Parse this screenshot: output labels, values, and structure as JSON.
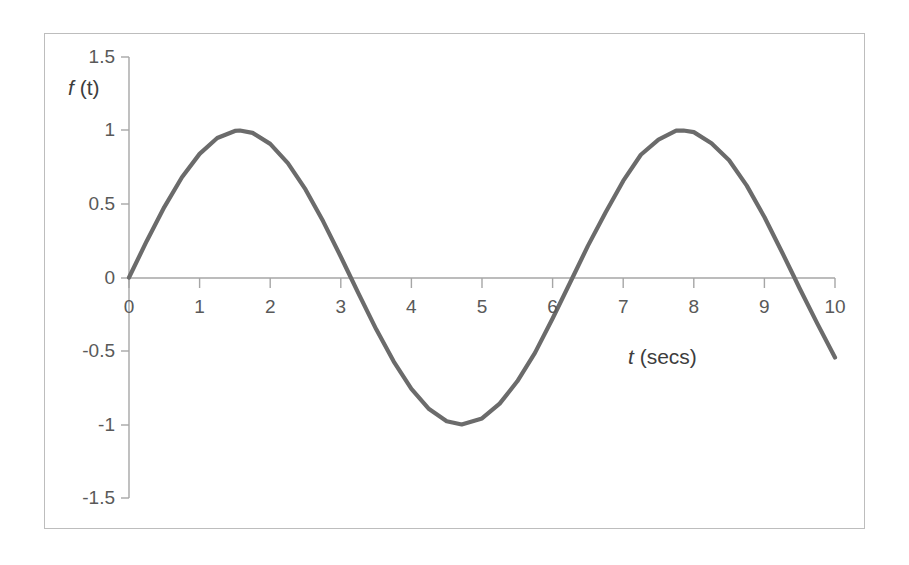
{
  "figure": {
    "background_color": "#ffffff",
    "frame_border_color": "#bdbdbd",
    "axis_color": "#a6a6a6",
    "curve_color": "#6b6b6b",
    "tick_label_color": "#595959"
  },
  "labels": {
    "y_axis_title_var": "f",
    "y_axis_title_rest": " (t)",
    "x_axis_title_var": "t",
    "x_axis_title_rest": " (secs)"
  },
  "chart_data": {
    "type": "line",
    "title": "",
    "subtitle": "",
    "xlabel": "t (secs)",
    "ylabel": "f (t)",
    "xlim": [
      0,
      10
    ],
    "ylim": [
      -1.5,
      1.5
    ],
    "grid": false,
    "legend": "none",
    "x_ticks": [
      0,
      1,
      2,
      3,
      4,
      5,
      6,
      7,
      8,
      9,
      10
    ],
    "x_tick_labels": [
      "0",
      "1",
      "2",
      "3",
      "4",
      "5",
      "6",
      "7",
      "8",
      "9",
      "10"
    ],
    "y_ticks": [
      -1.5,
      -1,
      -0.5,
      0,
      0.5,
      1,
      1.5
    ],
    "y_tick_labels": [
      "-1.5",
      "-1",
      "-0.5",
      "0",
      "0.5",
      "1",
      "1.5"
    ],
    "series": [
      {
        "name": "f(t) = sin(t)",
        "function": "sin(t)",
        "x": [
          0,
          0.25,
          0.5,
          0.75,
          1,
          1.25,
          1.5,
          1.5708,
          1.75,
          2,
          2.25,
          2.5,
          2.75,
          3,
          3.1416,
          3.25,
          3.5,
          3.75,
          4,
          4.25,
          4.5,
          4.7124,
          5,
          5.25,
          5.5,
          5.75,
          6,
          6.2832,
          6.5,
          6.75,
          7,
          7.25,
          7.5,
          7.75,
          7.854,
          8,
          8.25,
          8.5,
          8.75,
          9,
          9.25,
          9.4248,
          9.5,
          9.75,
          10
        ],
        "y": [
          0,
          0.247,
          0.479,
          0.682,
          0.841,
          0.949,
          0.997,
          1,
          0.984,
          0.909,
          0.778,
          0.599,
          0.382,
          0.141,
          0,
          -0.108,
          -0.351,
          -0.572,
          -0.757,
          -0.895,
          -0.978,
          -1,
          -0.959,
          -0.858,
          -0.706,
          -0.513,
          -0.279,
          0,
          0.215,
          0.442,
          0.657,
          0.835,
          0.938,
          0.999,
          1,
          0.989,
          0.913,
          0.798,
          0.625,
          0.412,
          0.172,
          0,
          -0.075,
          -0.314,
          -0.544
        ]
      }
    ],
    "annotations": []
  },
  "axes_geometry": {
    "x_axis_y_value": 0,
    "y_axis_x_value": 0,
    "tick_count_x": 11,
    "tick_count_y": 7
  }
}
